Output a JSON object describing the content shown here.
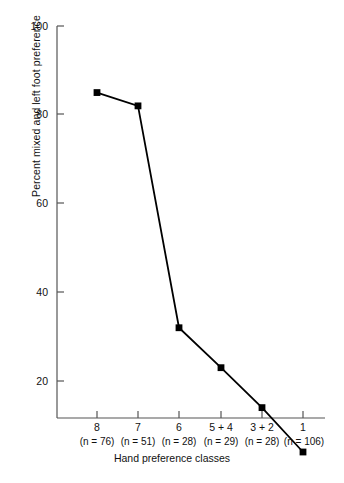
{
  "chart_data": {
    "type": "line",
    "title": "",
    "xlabel": "Hand preference classes",
    "ylabel": "Percent mixed and left foot preference",
    "categories": [
      "8",
      "7",
      "6",
      "5 + 4",
      "3 + 2",
      "1"
    ],
    "group_sizes": [
      "(n = 76)",
      "(n = 51)",
      "(n = 28)",
      "(n = 29)",
      "(n = 28)",
      "(n = 106)"
    ],
    "values": [
      85,
      82,
      32,
      23,
      14,
      4
    ],
    "ylim": [
      0,
      100
    ],
    "ytick_labels": [
      "100",
      "80",
      "60",
      "40",
      "20"
    ],
    "yticks": [
      100,
      80,
      60,
      40,
      20
    ],
    "grid": false,
    "legend": "none",
    "marker": "square",
    "series_color": "#000000",
    "line_color": "#000000"
  },
  "axis": {
    "y_title": "Percent mixed and left foot preference",
    "x_title": "Hand preference classes"
  },
  "colors": {
    "background": "#ffffff",
    "axis": "#555555",
    "data": "#000000",
    "text": "#111111"
  }
}
